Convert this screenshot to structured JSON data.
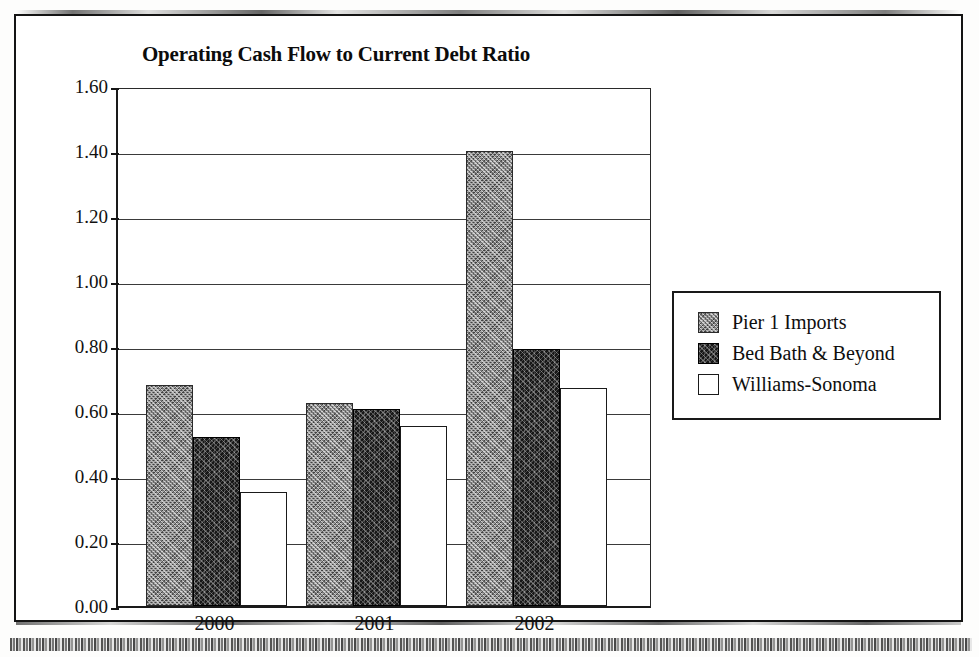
{
  "chart_data": {
    "type": "bar",
    "title": "Operating Cash Flow to Current Debt Ratio",
    "xlabel": "",
    "ylabel": "",
    "categories": [
      "2000",
      "2001",
      "2002"
    ],
    "series": [
      {
        "name": "Pier 1 Imports",
        "values": [
          0.68,
          0.625,
          1.4
        ],
        "swatch": "grey-speckled"
      },
      {
        "name": "Bed Bath & Beyond",
        "values": [
          0.52,
          0.605,
          0.79
        ],
        "swatch": "black-textured"
      },
      {
        "name": "Williams-Sonoma",
        "values": [
          0.35,
          0.555,
          0.67
        ],
        "swatch": "white-outlined"
      }
    ],
    "ylim": [
      0.0,
      1.6
    ],
    "ytick_step": 0.2,
    "ytick_labels": [
      "1.60",
      "1.40",
      "1.20",
      "1.00",
      "0.80",
      "0.60",
      "0.40",
      "0.20",
      "0.00"
    ],
    "ytick_values": [
      1.6,
      1.4,
      1.2,
      1.0,
      0.8,
      0.6,
      0.4,
      0.2,
      0.0
    ],
    "grid": true,
    "legend_position": "right"
  },
  "legend": {
    "items": [
      {
        "label": "Pier 1 Imports"
      },
      {
        "label": "Bed Bath & Beyond"
      },
      {
        "label": "Williams-Sonoma"
      }
    ]
  },
  "colors": {
    "series_pier1": "#8e8e8e",
    "series_bedbath": "#171717",
    "series_williams": "#ffffff",
    "axis": "#1a1a1a",
    "grid": "#3a3a3a",
    "text": "#111111",
    "page_background": "#ffffff"
  }
}
